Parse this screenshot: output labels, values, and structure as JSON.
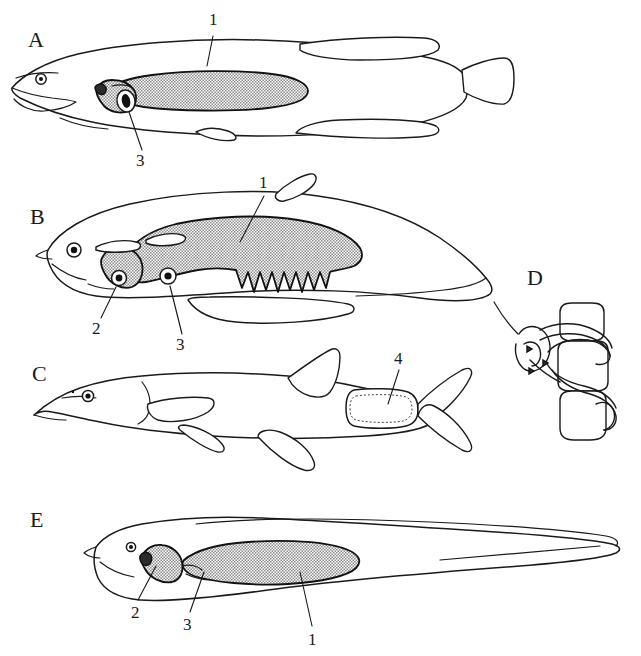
{
  "figure": {
    "background_color": "#ffffff",
    "ink_color": "#1a1a1a",
    "stipple_color": "#8c8c8c",
    "panels": [
      {
        "id": "A",
        "letter": "A",
        "label_x": 28,
        "label_y": 47,
        "description": "elongate fusiform fish, lateral view, stippled gas bladder"
      },
      {
        "id": "B",
        "letter": "B",
        "label_x": 30,
        "label_y": 224,
        "description": "deep-bodied fish, lateral view, stippled lobed gas bladder"
      },
      {
        "id": "C",
        "letter": "C",
        "label_x": 32,
        "label_y": 381,
        "description": "long-snouted fish with forked caudal fin, dotted caudal structure"
      },
      {
        "id": "D",
        "letter": "D",
        "label_x": 527,
        "label_y": 285,
        "description": "detail inset of vertebrae with looping tubular connection"
      },
      {
        "id": "E",
        "letter": "E",
        "label_x": 30,
        "label_y": 527,
        "description": "eel-like fish with tapering tail, stippled gas bladder"
      }
    ],
    "callouts": [
      {
        "panel": "A",
        "number": "1",
        "x": 213,
        "y": 23
      },
      {
        "panel": "A",
        "number": "3",
        "x": 139,
        "y": 160
      },
      {
        "panel": "B",
        "number": "1",
        "x": 263,
        "y": 182
      },
      {
        "panel": "B",
        "number": "2",
        "x": 96,
        "y": 328
      },
      {
        "panel": "B",
        "number": "3",
        "x": 180,
        "y": 344
      },
      {
        "panel": "C",
        "number": "4",
        "x": 398,
        "y": 358
      },
      {
        "panel": "E",
        "number": "2",
        "x": 135,
        "y": 612
      },
      {
        "panel": "E",
        "number": "3",
        "x": 187,
        "y": 624
      },
      {
        "panel": "E",
        "number": "1",
        "x": 312,
        "y": 639
      }
    ],
    "legend_keys": [
      {
        "key": "1",
        "meaning": "gas bladder"
      },
      {
        "key": "2",
        "meaning": "anterior chamber / connection"
      },
      {
        "key": "3",
        "meaning": "duct opening"
      },
      {
        "key": "4",
        "meaning": "caudal structure"
      }
    ]
  }
}
